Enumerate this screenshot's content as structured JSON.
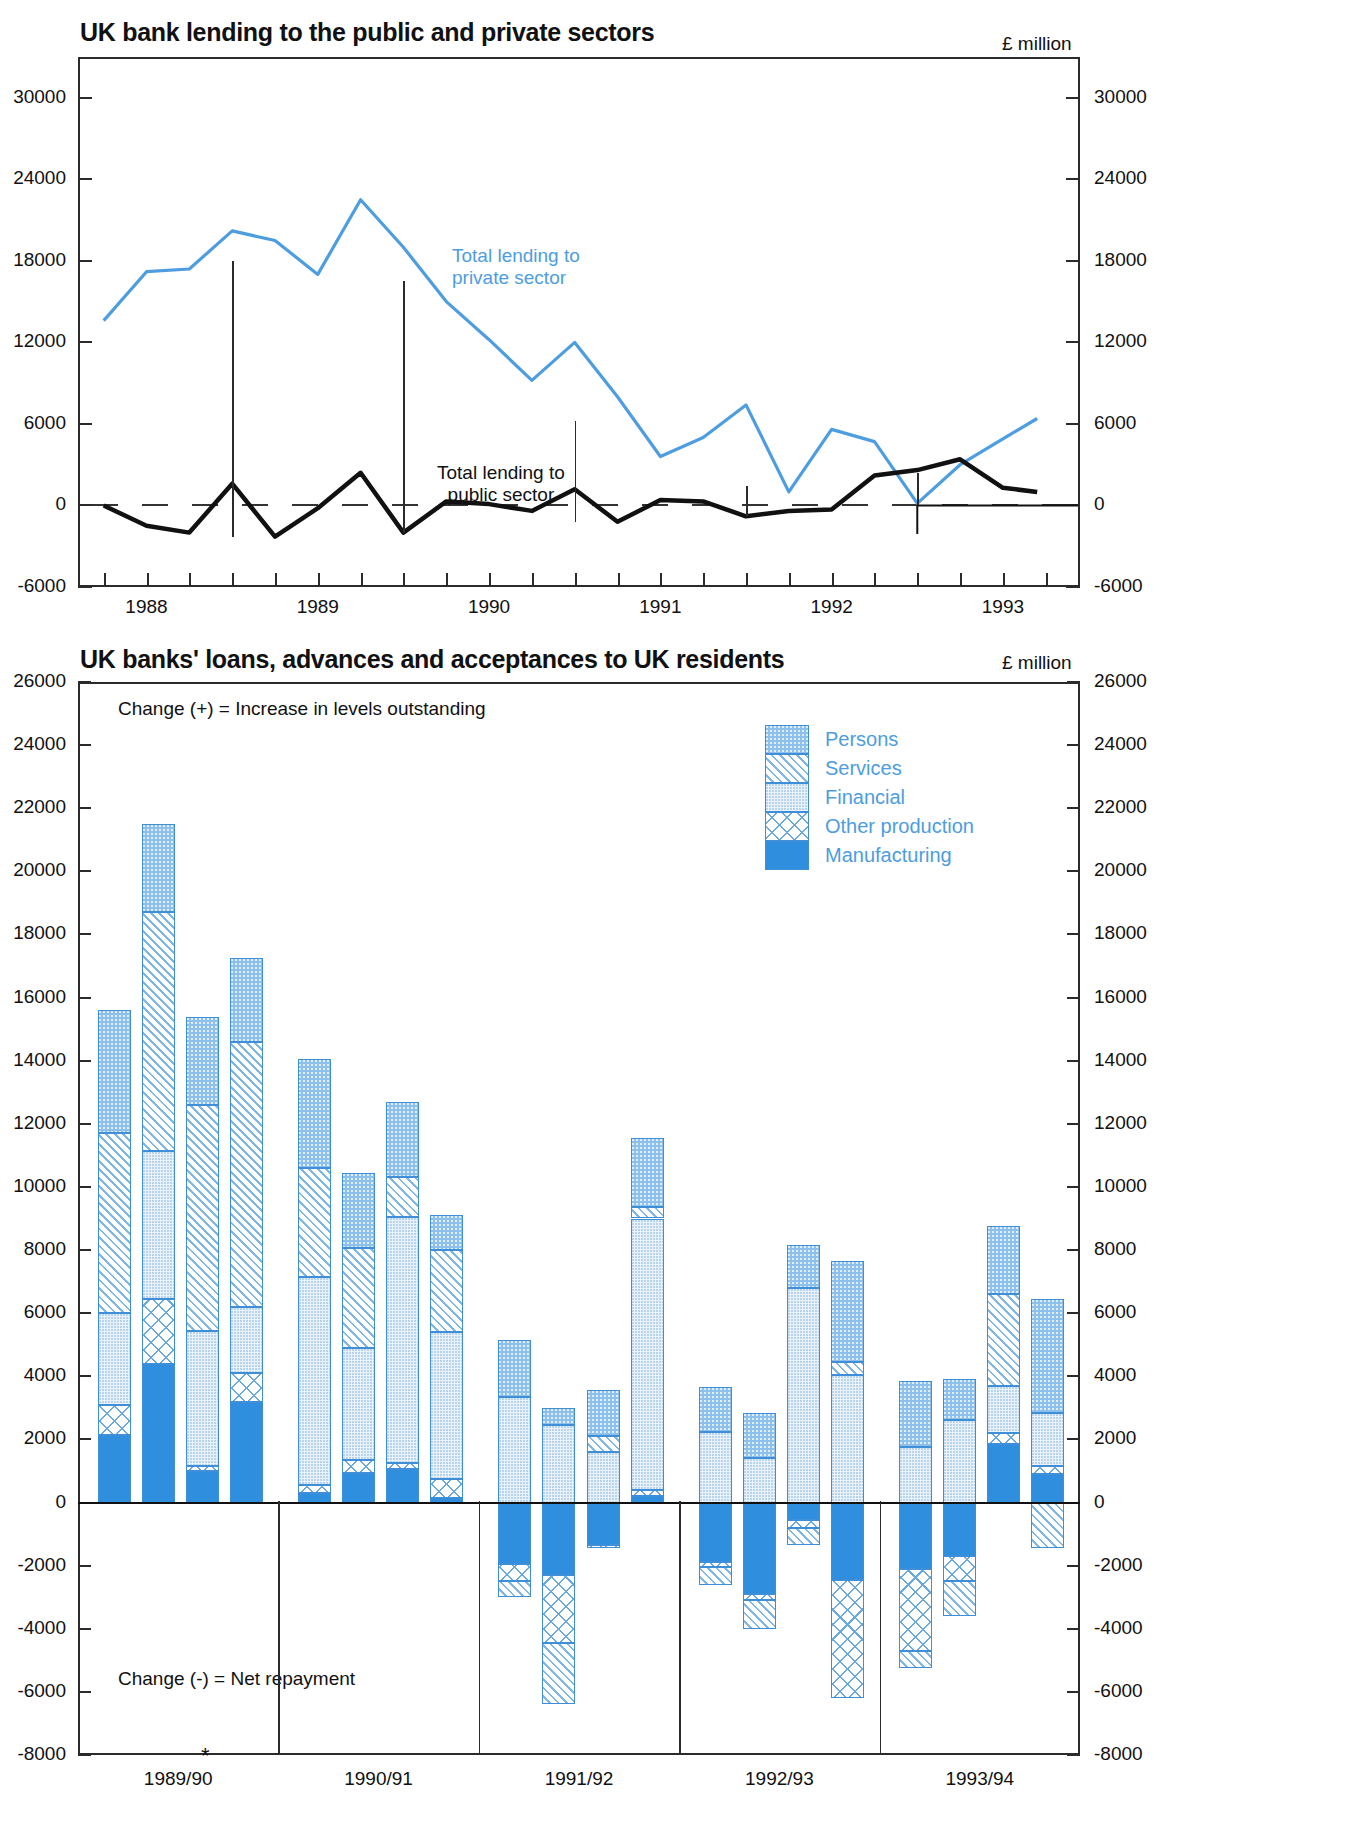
{
  "top": {
    "title": "UK bank lending to the public and private sectors",
    "units": "£ million",
    "label_private": "Total lending to\nprivate sector",
    "label_private_line1": "Total lending to",
    "label_private_line2": "private sector",
    "label_public_line1": "Total lending to",
    "label_public_line2": "public sector",
    "colors": {
      "private": "#4d9de0",
      "public": "#111111"
    }
  },
  "bottom": {
    "title": "UK banks' loans, advances and acceptances to UK residents",
    "units": "£ million",
    "note_positive": "Change (+) = Increase in levels outstanding",
    "note_negative": "Change (-) = Net repayment",
    "footnote_marker": "*",
    "legend_position": "top-right",
    "legend": [
      {
        "label": "Persons",
        "pattern": "persons",
        "color": "#8dc0ea"
      },
      {
        "label": "Services",
        "pattern": "services",
        "color": "#7fb6e4"
      },
      {
        "label": "Financial",
        "pattern": "financial",
        "color": "#eaf3fb"
      },
      {
        "label": "Other production",
        "pattern": "other",
        "color": "#6aa9dd"
      },
      {
        "label": "Manufacturing",
        "pattern": "manufacturing",
        "color": "#2f8ede"
      }
    ]
  },
  "chart_data": [
    {
      "type": "line",
      "title": "UK bank lending to the public and private sectors",
      "xlabel": "",
      "ylabel": "£ million",
      "ylim": [
        -6000,
        33000
      ],
      "yticks": [
        30000,
        24000,
        18000,
        12000,
        6000,
        0,
        -6000
      ],
      "xticks": [
        1988,
        1989,
        1990,
        1991,
        1992,
        1993
      ],
      "xtick_labels": [
        "1988",
        "1989",
        "1990",
        "1991",
        "1992",
        "1993"
      ],
      "xlim": [
        1987.6,
        1993.45
      ],
      "grid": false,
      "legend": "inline-annotations",
      "series": [
        {
          "name": "Total lending to private sector",
          "color": "#4d9de0",
          "x": [
            1987.75,
            1988.0,
            1988.25,
            1988.5,
            1988.75,
            1989.0,
            1989.25,
            1989.5,
            1989.75,
            1990.0,
            1990.25,
            1990.5,
            1990.75,
            1991.0,
            1991.25,
            1991.5,
            1991.75,
            1992.0,
            1992.25,
            1992.5,
            1992.75,
            1993.0,
            1993.2
          ],
          "y": [
            13600,
            17200,
            17400,
            20200,
            19500,
            17000,
            22500,
            19000,
            15000,
            12200,
            9200,
            12000,
            8000,
            3600,
            5000,
            7400,
            1000,
            5600,
            4700,
            150,
            3000,
            4900,
            6400
          ]
        },
        {
          "name": "Total lending to public sector",
          "color": "#111111",
          "x": [
            1987.75,
            1988.0,
            1988.25,
            1988.5,
            1988.75,
            1989.0,
            1989.25,
            1989.5,
            1989.75,
            1990.0,
            1990.25,
            1990.5,
            1990.75,
            1991.0,
            1991.25,
            1991.5,
            1991.75,
            1992.0,
            1992.25,
            1992.5,
            1992.75,
            1993.0,
            1993.2
          ],
          "y": [
            0,
            -1500,
            -2000,
            1600,
            -2300,
            -200,
            2400,
            -2000,
            300,
            100,
            -400,
            1200,
            -1200,
            400,
            300,
            -800,
            -400,
            -300,
            2200,
            2600,
            3400,
            1300,
            1000
          ]
        }
      ]
    },
    {
      "type": "bar",
      "subtype": "stacked",
      "title": "UK banks' loans, advances and acceptances to UK residents",
      "xlabel": "",
      "ylabel": "£ million",
      "ylim": [
        -8000,
        26000
      ],
      "yticks": [
        26000,
        24000,
        22000,
        20000,
        18000,
        16000,
        14000,
        12000,
        10000,
        8000,
        6000,
        4000,
        2000,
        0,
        -2000,
        -4000,
        -6000,
        -8000
      ],
      "group_labels": [
        "1989/90",
        "1990/91",
        "1991/92",
        "1992/93",
        "1993/94"
      ],
      "bars_per_group": 4,
      "grid": false,
      "series": [
        {
          "name": "Manufacturing",
          "pattern": "manufacturing",
          "values": [
            2150,
            4400,
            1000,
            3200,
            300,
            950,
            1050,
            150,
            -1950,
            -2300,
            -1350,
            200,
            -1900,
            -2900,
            -550,
            -2450,
            -2100,
            -1700,
            1850,
            900
          ]
        },
        {
          "name": "Other production",
          "pattern": "other",
          "values": [
            950,
            2050,
            150,
            900,
            250,
            400,
            200,
            600,
            -550,
            -2150,
            -100,
            200,
            -150,
            -200,
            -250,
            -3750,
            -2600,
            -800,
            350,
            250
          ]
        },
        {
          "name": "Financial",
          "pattern": "financial",
          "values": [
            2900,
            4700,
            4300,
            2100,
            6600,
            3550,
            7800,
            4650,
            3350,
            2450,
            1600,
            8600,
            2250,
            1400,
            6800,
            4050,
            1750,
            2600,
            1500,
            1700
          ]
        },
        {
          "name": "Services",
          "pattern": "services",
          "values": [
            5700,
            7550,
            7150,
            8400,
            3450,
            3150,
            1250,
            2600,
            -500,
            -1950,
            500,
            350,
            -550,
            -900,
            -550,
            400,
            -550,
            -1100,
            2900,
            -1450
          ]
        },
        {
          "name": "Persons",
          "pattern": "persons",
          "values": [
            3900,
            2800,
            2800,
            2650,
            3450,
            2400,
            2400,
            1100,
            1800,
            550,
            1450,
            2200,
            1400,
            1450,
            1350,
            3200,
            2100,
            1300,
            2150,
            3600
          ]
        }
      ]
    }
  ]
}
